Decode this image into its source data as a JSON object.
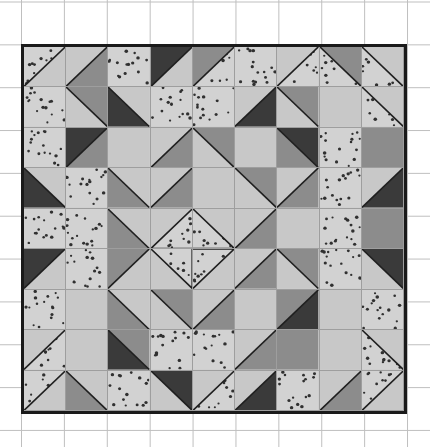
{
  "artwork": {
    "title": "Quilt block pattern on graph paper",
    "type": "patchwork-quilt-diagram",
    "grid_rows": 9,
    "grid_cols": 9,
    "background": {
      "name": "graph-paper",
      "paper_color": "#ffffff",
      "grid_line_color": "#bfbfbf",
      "grid_spacing_px": 43
    },
    "border_color": "#1a1a1a",
    "seam_line_color": "#787878"
  },
  "palette": {
    "light": "#c8c8c8",
    "light_label": "light gray solid",
    "dotted": "#d2d2d2",
    "dotted_label": "dotted / polka-dot print",
    "dot_color": "#303030",
    "medium": "#8c8c8c",
    "medium_label": "medium gray solid",
    "dark": "#3a3a3a",
    "dark_label": "dark charcoal solid",
    "seam": "#1f1f1f"
  },
  "legend": [
    {
      "swatch": "light",
      "label": "Light gray"
    },
    {
      "swatch": "dotted",
      "label": "Dotted print"
    },
    {
      "swatch": "medium",
      "label": "Medium gray"
    },
    {
      "swatch": "dark",
      "label": "Dark charcoal"
    }
  ],
  "chart_data": {
    "type": "heatmap",
    "xlabel": "column",
    "ylabel": "row",
    "categories": [
      "c1",
      "c2",
      "c3",
      "c4",
      "c5",
      "c6",
      "c7",
      "c8",
      "c9"
    ],
    "rows": [
      "r1",
      "r2",
      "r3",
      "r4",
      "r5",
      "r6",
      "r7",
      "r8",
      "r9"
    ],
    "legend": [
      "light",
      "dotted",
      "medium",
      "dark"
    ],
    "cell_codes": "shape|fillA|fillB  — shape: S=solid, TL/TR/BL/BR = half-square triangle with the named corner carrying fillA, D=diamond-on-point",
    "cells": [
      [
        "TL|dotted|light",
        "TL|light|medium",
        "S|dotted|dotted",
        "TL|dark|light",
        "TL|medium|dotted",
        "S|dotted|dotted",
        "TL|light|dotted",
        "TR|medium|dotted",
        "TR|light|dotted"
      ],
      [
        "S|dotted|dotted",
        "BL|light|medium",
        "BL|dark|light",
        "S|dotted|dotted",
        "S|dotted|dotted",
        "BR|dark|light",
        "TR|medium|light",
        "S|light|light",
        "TR|light|dotted"
      ],
      [
        "S|dotted|dotted",
        "TL|dark|medium",
        "S|light|light",
        "TL|light|medium",
        "TR|medium|light",
        "S|light|light",
        "TR|dark|medium",
        "S|dotted|dotted",
        "S|medium|medium"
      ],
      [
        "BL|dark|light",
        "S|dotted|dotted",
        "BL|medium|light",
        "TL|light|medium",
        "S|light|light",
        "TR|medium|light",
        "BR|medium|light",
        "S|dotted|dotted",
        "BR|dark|light"
      ],
      [
        "S|dotted|dotted",
        "S|dotted|dotted",
        "BL|medium|light",
        "D|light|dotted",
        "D|light|dotted",
        "BR|medium|light",
        "S|light|light",
        "S|dotted|dotted",
        "S|medium|medium"
      ],
      [
        "TL|dark|light",
        "S|dotted|dotted",
        "TL|medium|light",
        "D|light|dotted",
        "D|light|dotted",
        "TL|light|medium",
        "TR|medium|light",
        "S|dotted|dotted",
        "TR|dark|light"
      ],
      [
        "S|dotted|dotted",
        "S|light|light",
        "BL|medium|light",
        "BL|light|medium",
        "BR|medium|light",
        "S|light|light",
        "BR|dark|medium",
        "S|light|light",
        "S|dotted|dotted"
      ],
      [
        "TL|light|dotted",
        "S|light|light",
        "BL|dark|medium",
        "S|dotted|dotted",
        "S|dotted|dotted",
        "BR|medium|light",
        "S|medium|medium",
        "S|light|light",
        "TR|light|dotted"
      ],
      [
        "TL|dotted|light",
        "TR|light|medium",
        "S|dotted|dotted",
        "TR|dark|light",
        "TL|light|dotted",
        "BR|dark|light",
        "S|dotted|dotted",
        "TL|light|medium",
        "TL|dotted|light"
      ]
    ]
  }
}
